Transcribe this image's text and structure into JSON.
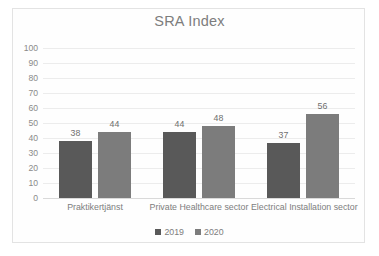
{
  "chart_data": {
    "type": "bar",
    "title": "SRA Index",
    "xlabel": "",
    "ylabel": "",
    "ylim": [
      0,
      100
    ],
    "yticks": [
      100,
      90,
      80,
      70,
      60,
      50,
      40,
      30,
      20,
      10,
      0
    ],
    "grid": true,
    "legend_position": "bottom",
    "categories": [
      "Praktikertjänst",
      "Private Healthcare sector",
      "Electrical Installation sector"
    ],
    "series": [
      {
        "name": "2019",
        "color": "#595959",
        "values": [
          38,
          44,
          37
        ]
      },
      {
        "name": "2020",
        "color": "#7c7c7c",
        "values": [
          44,
          48,
          56
        ]
      }
    ],
    "data_labels": [
      "38",
      "44",
      "44",
      "48",
      "37",
      "56"
    ]
  },
  "legend": {
    "items": [
      {
        "label": "2019"
      },
      {
        "label": "2020"
      }
    ]
  },
  "colors": {
    "series_2019": "#595959",
    "series_2020": "#7c7c7c",
    "gridline": "#ececec",
    "frame": "#e3e3e3",
    "text": "#7d7d7d"
  }
}
